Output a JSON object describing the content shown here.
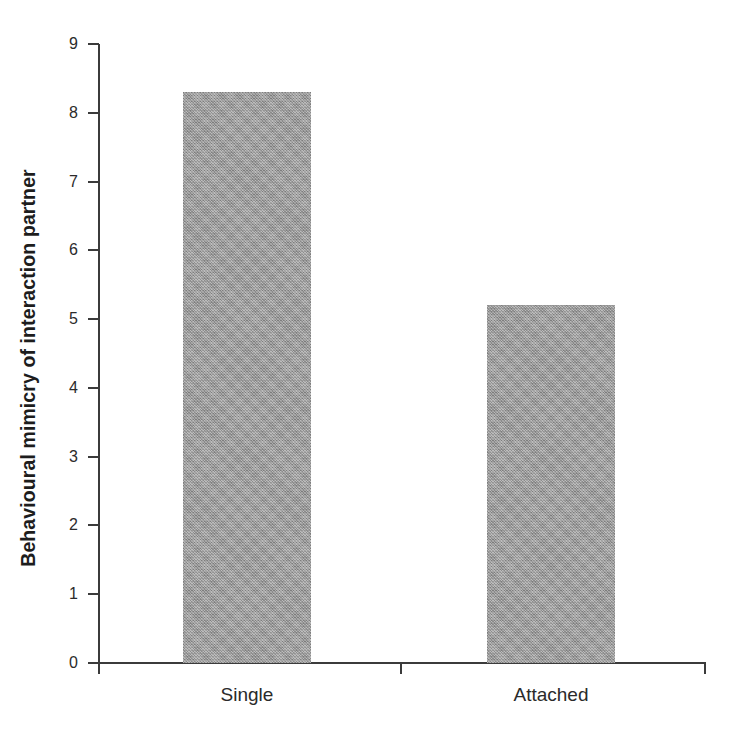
{
  "chart_data": {
    "type": "bar",
    "title": "",
    "subtitle": "",
    "xlabel": "",
    "ylabel": "Behavioural mimicry of interaction partner",
    "categories": [
      "Single",
      "Attached"
    ],
    "values": [
      8.3,
      5.2
    ],
    "series": [
      {
        "name": "Behavioural mimicry",
        "values": [
          8.3,
          5.2
        ]
      }
    ],
    "ylim": [
      0,
      9
    ],
    "ytick_labels": [
      "0",
      "1",
      "2",
      "3",
      "4",
      "5",
      "6",
      "7",
      "8",
      "9"
    ],
    "ytick_values": [
      0,
      1,
      2,
      3,
      4,
      5,
      6,
      7,
      8,
      9
    ],
    "grid": false,
    "legend": false,
    "legend_position": "none",
    "annotations": [],
    "colors": {
      "bar_fill": "#9d9d9d",
      "axis": "#3b3b3b",
      "text": "#2a2a2a",
      "background": "#ffffff"
    }
  }
}
